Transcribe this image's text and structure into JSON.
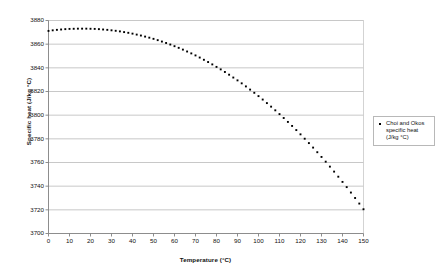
{
  "chart_data": {
    "type": "scatter",
    "title": "",
    "xlabel": "Temperature (°C)",
    "ylabel": "Specific heat (J/kg °C)",
    "xlim": [
      0,
      150
    ],
    "ylim": [
      3700,
      3880
    ],
    "xticks": [
      0,
      10,
      20,
      30,
      40,
      50,
      60,
      70,
      80,
      90,
      100,
      110,
      120,
      130,
      140,
      150
    ],
    "yticks": [
      3700,
      3720,
      3740,
      3760,
      3780,
      3800,
      3820,
      3840,
      3860,
      3880
    ],
    "xtick_labels": [
      "0",
      "10",
      "20",
      "30",
      "40",
      "50",
      "60",
      "70",
      "80",
      "90",
      "100",
      "110",
      "120",
      "130",
      "140",
      "150"
    ],
    "ytick_labels": [
      "3700",
      "3720",
      "3740",
      "3760",
      "3780",
      "3800",
      "3820",
      "3840",
      "3860",
      "3880"
    ],
    "grid": "horizontal",
    "legend_position": "right-outside",
    "marker": "square",
    "marker_color": "#000000",
    "series": [
      {
        "name": "Choi and Okos specific heat (J/kg °C)",
        "x": [
          0,
          2,
          4,
          6,
          8,
          10,
          12,
          14,
          16,
          18,
          20,
          22,
          24,
          26,
          28,
          30,
          32,
          34,
          36,
          38,
          40,
          42,
          44,
          46,
          48,
          50,
          52,
          54,
          56,
          58,
          60,
          62,
          64,
          66,
          68,
          70,
          72,
          74,
          76,
          78,
          80,
          82,
          84,
          86,
          88,
          90,
          92,
          94,
          96,
          98,
          100,
          102,
          104,
          106,
          108,
          110,
          112,
          114,
          116,
          118,
          120,
          122,
          124,
          126,
          128,
          130,
          132,
          134,
          136,
          138,
          140,
          142,
          144,
          146,
          148,
          150
        ],
        "y": [
          3871.2,
          3871.7,
          3872.1,
          3872.4,
          3872.7,
          3872.9,
          3873.0,
          3873.1,
          3873.1,
          3873.1,
          3873.0,
          3872.9,
          3872.7,
          3872.4,
          3872.1,
          3871.7,
          3871.3,
          3870.8,
          3870.2,
          3869.6,
          3868.9,
          3868.1,
          3867.3,
          3866.4,
          3865.5,
          3864.5,
          3863.4,
          3862.2,
          3861.0,
          3859.7,
          3858.3,
          3856.9,
          3855.4,
          3853.8,
          3852.2,
          3850.5,
          3848.7,
          3846.8,
          3844.9,
          3842.9,
          3840.8,
          3838.7,
          3836.5,
          3834.2,
          3831.8,
          3829.4,
          3826.9,
          3824.3,
          3821.6,
          3818.9,
          3816.1,
          3813.2,
          3810.2,
          3807.2,
          3804.1,
          3800.9,
          3797.6,
          3794.3,
          3790.9,
          3787.4,
          3783.8,
          3780.1,
          3776.4,
          3772.6,
          3768.7,
          3764.7,
          3760.7,
          3756.5,
          3752.3,
          3748.0,
          3743.6,
          3739.2,
          3734.6,
          3730.0,
          3725.3,
          3720.5
        ]
      }
    ]
  },
  "legend": {
    "entries": [
      {
        "label": "Choi and Okos specific heat (J/kg °C)"
      }
    ]
  },
  "axes": {
    "x_title": "Temperature (°C)",
    "y_title": "Specific heat (J/kg °C)"
  },
  "colors": {
    "marker": "#000000",
    "gridline": "#b0b0b0",
    "axis": "#808080",
    "plot_border": "#c8c8c8",
    "legend_border": "#b8b8b8",
    "background": "#ffffff"
  }
}
